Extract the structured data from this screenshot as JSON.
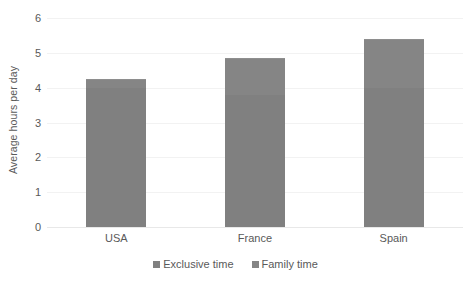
{
  "chart_data": {
    "type": "bar",
    "subtype": "stacked-column",
    "title": "",
    "xlabel": "",
    "ylabel": "Average hours per day",
    "ylim": [
      0,
      6
    ],
    "ytick_labels": [
      "6",
      "5",
      "4",
      "3",
      "2",
      "1",
      "0"
    ],
    "ytick_values": [
      6,
      5,
      4,
      3,
      2,
      1,
      0
    ],
    "grid": "horizontal",
    "legend_position": "bottom-center",
    "categories": [
      "USA",
      "France",
      "Spain"
    ],
    "series": [
      {
        "name": "Exclusive time",
        "color": "#808080",
        "values": [
          4.0,
          3.8,
          4.0
        ]
      },
      {
        "name": "Family time",
        "color": "#858585",
        "values": [
          0.25,
          1.05,
          1.4
        ]
      }
    ],
    "totals": [
      4.25,
      4.85,
      5.4
    ]
  },
  "axes": {
    "y_title": "Average hours per day"
  },
  "legend": {
    "items": [
      {
        "label": "Exclusive time",
        "color": "#808080"
      },
      {
        "label": "Family time",
        "color": "#858585"
      }
    ]
  },
  "colors": {
    "gridline": "#f2f2f2",
    "baseline": "#e8e8e8",
    "text": "#595959",
    "background": "#ffffff"
  }
}
